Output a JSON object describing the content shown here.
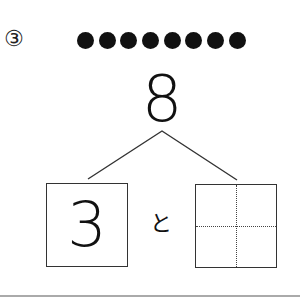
{
  "question": {
    "number_label": "③",
    "dot_count": 8,
    "dot_color": "#111111",
    "total": "8",
    "parts": {
      "left_value": "3",
      "connector": "と",
      "right_value": ""
    }
  },
  "divider_color": "#aaaaaa"
}
